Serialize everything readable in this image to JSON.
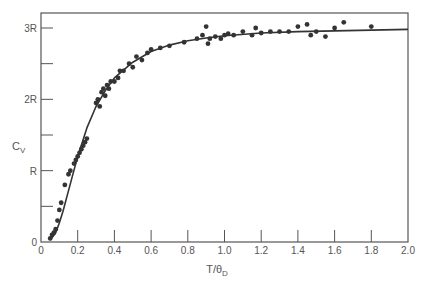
{
  "chart_data": {
    "type": "scatter",
    "title": "",
    "xlabel": "T/θD",
    "ylabel": "Cv",
    "xlim": [
      0,
      2.0
    ],
    "ylim": [
      0,
      3
    ],
    "x_ticks": [
      0,
      0.2,
      0.4,
      0.6,
      0.8,
      1.0,
      1.2,
      1.4,
      1.6,
      1.8,
      2.0
    ],
    "x_tick_labels": [
      "0",
      "0.2",
      "0.4",
      "0.6",
      "0.8",
      "1.0",
      "1.2",
      "1.4",
      "1.6",
      "1.8",
      "2.0"
    ],
    "y_ticks": [
      0,
      0.5,
      1,
      1.5,
      2,
      2.5,
      3
    ],
    "y_tick_labels": [
      "0",
      "",
      "R",
      "",
      "2R",
      "",
      "3R"
    ],
    "grid": false,
    "legend": null,
    "series": [
      {
        "name": "Debye model curve",
        "kind": "line",
        "x": [
          0.05,
          0.08,
          0.1,
          0.12,
          0.15,
          0.2,
          0.25,
          0.3,
          0.35,
          0.4,
          0.5,
          0.6,
          0.7,
          0.8,
          0.9,
          1.0,
          1.2,
          1.4,
          1.6,
          1.8,
          2.0
        ],
        "y": [
          0.03,
          0.13,
          0.27,
          0.43,
          0.72,
          1.2,
          1.6,
          1.9,
          2.12,
          2.3,
          2.52,
          2.67,
          2.76,
          2.82,
          2.86,
          2.89,
          2.93,
          2.95,
          2.96,
          2.97,
          2.98
        ]
      },
      {
        "name": "Experimental data",
        "kind": "scatter",
        "x": [
          0.05,
          0.06,
          0.07,
          0.08,
          0.09,
          0.1,
          0.11,
          0.13,
          0.15,
          0.16,
          0.18,
          0.19,
          0.2,
          0.21,
          0.22,
          0.23,
          0.24,
          0.25,
          0.3,
          0.31,
          0.32,
          0.33,
          0.34,
          0.35,
          0.36,
          0.37,
          0.38,
          0.4,
          0.42,
          0.43,
          0.45,
          0.48,
          0.5,
          0.52,
          0.55,
          0.58,
          0.6,
          0.65,
          0.7,
          0.78,
          0.85,
          0.88,
          0.9,
          0.91,
          0.92,
          0.95,
          0.98,
          1.0,
          1.02,
          1.05,
          1.1,
          1.15,
          1.17,
          1.2,
          1.25,
          1.3,
          1.35,
          1.4,
          1.45,
          1.47,
          1.5,
          1.55,
          1.6,
          1.65,
          1.8
        ],
        "y": [
          0.05,
          0.1,
          0.13,
          0.18,
          0.3,
          0.45,
          0.55,
          0.8,
          0.95,
          1.0,
          1.1,
          1.15,
          1.2,
          1.25,
          1.3,
          1.35,
          1.4,
          1.45,
          1.95,
          2.0,
          1.9,
          2.1,
          2.15,
          2.05,
          2.2,
          2.15,
          2.25,
          2.25,
          2.3,
          2.4,
          2.4,
          2.5,
          2.45,
          2.6,
          2.55,
          2.65,
          2.7,
          2.72,
          2.75,
          2.8,
          2.85,
          2.9,
          3.02,
          2.78,
          2.85,
          2.88,
          2.85,
          2.9,
          2.92,
          2.9,
          2.95,
          2.9,
          3.0,
          2.93,
          2.95,
          2.95,
          2.95,
          3.02,
          3.05,
          2.9,
          2.95,
          2.88,
          3.0,
          3.08,
          3.02
        ]
      }
    ]
  }
}
